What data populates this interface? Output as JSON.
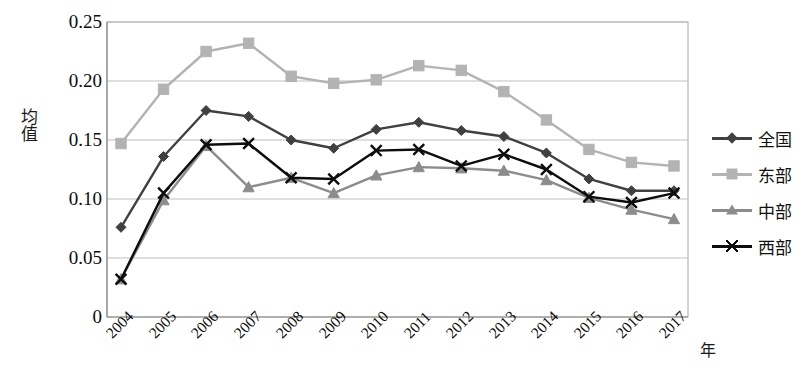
{
  "chart_data": {
    "type": "line",
    "title": "",
    "xlabel": "年",
    "ylabel": "均值",
    "categories": [
      "2004",
      "2005",
      "2006",
      "2007",
      "2008",
      "2009",
      "2010",
      "2011",
      "2012",
      "2013",
      "2014",
      "2015",
      "2016",
      "2017"
    ],
    "x": [
      2004,
      2005,
      2006,
      2007,
      2008,
      2009,
      2010,
      2011,
      2012,
      2013,
      2014,
      2015,
      2016,
      2017
    ],
    "ylim": [
      0,
      0.25
    ],
    "xlim": [
      2004,
      2017
    ],
    "ytick_labels": [
      "0.25",
      "0.20",
      "0.15",
      "0.10",
      "0.05",
      "0"
    ],
    "ytick_values": [
      0.25,
      0.2,
      0.15,
      0.1,
      0.05,
      0
    ],
    "grid": true,
    "grid_axis": "y",
    "legend_position": "right",
    "series": [
      {
        "name": "全国",
        "marker": "diamond",
        "color": "#404040",
        "values": [
          0.076,
          0.136,
          0.175,
          0.17,
          0.15,
          0.143,
          0.159,
          0.165,
          0.158,
          0.153,
          0.139,
          0.117,
          0.107,
          0.107
        ]
      },
      {
        "name": "东部",
        "marker": "square",
        "color": "#b3b3b3",
        "values": [
          0.147,
          0.193,
          0.225,
          0.232,
          0.204,
          0.198,
          0.201,
          0.213,
          0.209,
          0.191,
          0.167,
          0.142,
          0.131,
          0.128
        ]
      },
      {
        "name": "中部",
        "marker": "triangle",
        "color": "#8c8c8c",
        "values": [
          0.032,
          0.099,
          0.145,
          0.11,
          0.118,
          0.105,
          0.12,
          0.127,
          0.126,
          0.124,
          0.116,
          0.101,
          0.091,
          0.083
        ]
      },
      {
        "name": "西部",
        "marker": "cross",
        "color": "#0d0d0d",
        "values": [
          0.032,
          0.105,
          0.146,
          0.147,
          0.118,
          0.117,
          0.141,
          0.142,
          0.128,
          0.138,
          0.125,
          0.102,
          0.097,
          0.105
        ]
      }
    ]
  },
  "axis": {
    "y_title": "均值",
    "x_title": "年"
  },
  "legend": {
    "items": [
      {
        "label": "全国"
      },
      {
        "label": "东部"
      },
      {
        "label": "中部"
      },
      {
        "label": "西部"
      }
    ]
  }
}
